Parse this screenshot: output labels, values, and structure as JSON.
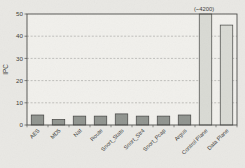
{
  "figure": {
    "kind": "scanned-paper-figure",
    "background_color": "#e9e8e4",
    "plot_background_color": "#f1f0ec"
  },
  "chart_data": {
    "type": "bar",
    "title": "",
    "xlabel": "",
    "ylabel": "IPC",
    "ylim": [
      0,
      50
    ],
    "yticks": [
      0,
      10,
      20,
      30,
      40,
      50
    ],
    "grid": "horizontal dashed gridlines at y ticks, boxed plot border",
    "legend_position": "none",
    "categories": [
      "AES",
      "MD5",
      "Nat",
      "Route",
      "Snort_Stats",
      "Snort_Str4",
      "Snort_Pcap",
      "Argus",
      "Control Plane",
      "Data Plane"
    ],
    "values": [
      4.5,
      2.5,
      4,
      4,
      5,
      4,
      4,
      4.5,
      4200,
      45
    ],
    "clipped_at_ylim": [
      false,
      false,
      false,
      false,
      false,
      false,
      false,
      false,
      true,
      false
    ],
    "bar_groups": [
      "app",
      "app",
      "app",
      "app",
      "app",
      "app",
      "app",
      "app",
      "plane",
      "plane"
    ],
    "annotations": [
      {
        "category": "Control Plane",
        "text": "(~4200)"
      }
    ],
    "colors": {
      "app_bar": "#90948f",
      "plane_bar": "#d9dad4",
      "bar_outline": "#3f3f3d",
      "axis": "#4a4a48",
      "grid": "#8d8d8a",
      "text": "#3a3a38"
    }
  }
}
